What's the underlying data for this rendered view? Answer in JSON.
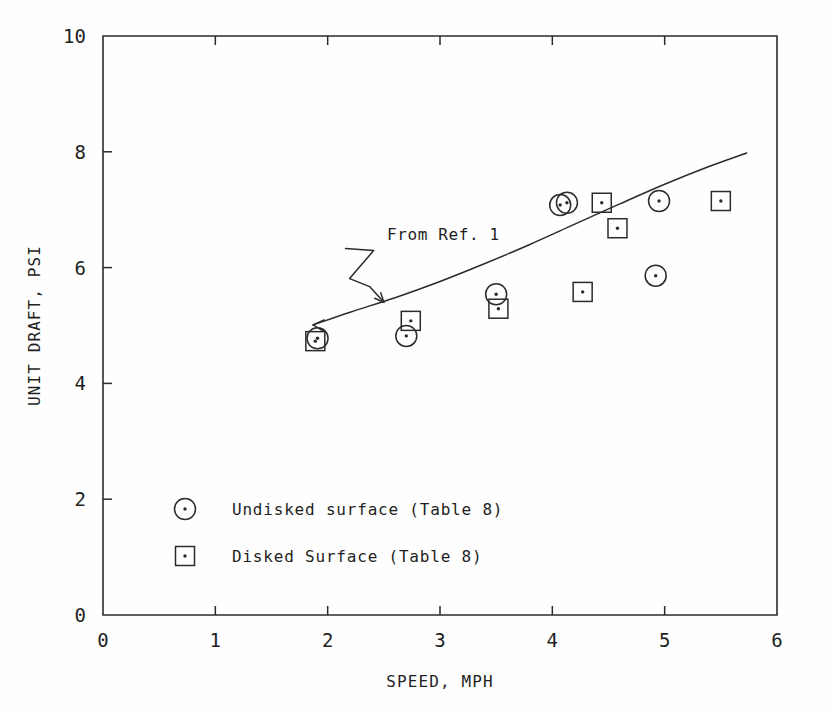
{
  "figure": {
    "background_color": "#fefefe",
    "ink_color": "#2b2b2b"
  },
  "chart_data": {
    "type": "scatter",
    "title": "",
    "xlabel": "SPEED, MPH",
    "ylabel": "UNIT DRAFT, PSI",
    "xlim": [
      0,
      6
    ],
    "ylim": [
      0,
      10
    ],
    "xticks": [
      0,
      1,
      2,
      3,
      4,
      5,
      6
    ],
    "yticks": [
      0,
      2,
      4,
      6,
      8,
      10
    ],
    "xtick_labels": [
      "0",
      "1",
      "2",
      "3",
      "4",
      "5",
      "6"
    ],
    "ytick_labels": [
      "0",
      "2",
      "4",
      "6",
      "8",
      "10"
    ],
    "grid": false,
    "legend_position": "lower-left-inside",
    "series": [
      {
        "name": "Undisked surface (Table 8)",
        "marker": "circle-dot",
        "points": [
          {
            "x": 1.91,
            "y": 4.78
          },
          {
            "x": 2.7,
            "y": 4.82
          },
          {
            "x": 3.5,
            "y": 5.54
          },
          {
            "x": 4.07,
            "y": 7.08
          },
          {
            "x": 4.13,
            "y": 7.12
          },
          {
            "x": 4.92,
            "y": 5.86
          },
          {
            "x": 4.95,
            "y": 7.15
          }
        ]
      },
      {
        "name": "Disked Surface (Table 8)",
        "marker": "square-dot",
        "points": [
          {
            "x": 1.89,
            "y": 4.73
          },
          {
            "x": 2.74,
            "y": 5.08
          },
          {
            "x": 3.52,
            "y": 5.29
          },
          {
            "x": 4.27,
            "y": 5.58
          },
          {
            "x": 4.44,
            "y": 7.12
          },
          {
            "x": 4.58,
            "y": 6.68
          },
          {
            "x": 5.5,
            "y": 7.15
          }
        ]
      }
    ],
    "curve": {
      "name": "From Ref. 1",
      "points": [
        {
          "x": 1.87,
          "y": 5.01
        },
        {
          "x": 2.2,
          "y": 5.23
        },
        {
          "x": 2.6,
          "y": 5.48
        },
        {
          "x": 3.0,
          "y": 5.76
        },
        {
          "x": 3.4,
          "y": 6.07
        },
        {
          "x": 3.8,
          "y": 6.4
        },
        {
          "x": 4.2,
          "y": 6.75
        },
        {
          "x": 4.6,
          "y": 7.1
        },
        {
          "x": 5.0,
          "y": 7.44
        },
        {
          "x": 5.4,
          "y": 7.75
        },
        {
          "x": 5.73,
          "y": 7.98
        }
      ]
    },
    "annotations": [
      {
        "text": "From Ref. 1",
        "text_x": 3.03,
        "text_y": 6.48,
        "arrow_from_x": 2.32,
        "arrow_from_y": 6.19,
        "arrow_to_x": 2.5,
        "arrow_to_y": 5.4
      }
    ]
  },
  "legend": {
    "items": [
      {
        "marker": "circle-dot",
        "label": "Undisked surface (Table 8)"
      },
      {
        "marker": "square-dot",
        "label": "Disked Surface (Table 8)"
      }
    ]
  },
  "axes": {
    "x_title": "SPEED, MPH",
    "y_title": "UNIT DRAFT, PSI"
  }
}
